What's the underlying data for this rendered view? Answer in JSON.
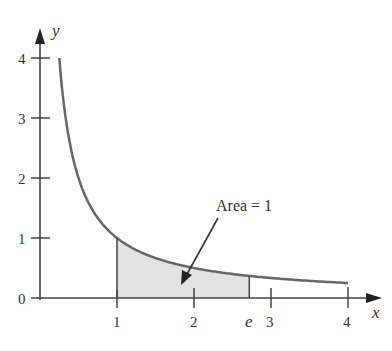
{
  "chart_data": {
    "type": "line",
    "title": "",
    "function": "y = 1/x",
    "xlabel": "x",
    "ylabel": "y",
    "xlim": [
      0,
      4.3
    ],
    "ylim": [
      0,
      4.3
    ],
    "x_ticks": [
      "1",
      "2",
      "e",
      "3",
      "4"
    ],
    "y_ticks": [
      "0",
      "1",
      "2",
      "3",
      "4"
    ],
    "series": [
      {
        "name": "y = 1/x",
        "x_range": [
          0.25,
          4
        ]
      }
    ],
    "shaded_region": {
      "from": 1,
      "to": 2.718,
      "label": "Area = 1"
    },
    "annotations": [
      "Area = 1"
    ]
  },
  "labels": {
    "xaxis": "x",
    "yaxis": "y",
    "y0": "0",
    "y1": "1",
    "y2": "2",
    "y3": "3",
    "y4": "4",
    "x1": "1",
    "x2": "2",
    "xe": "e",
    "x3": "3",
    "x4": "4",
    "area": "Area = 1"
  }
}
